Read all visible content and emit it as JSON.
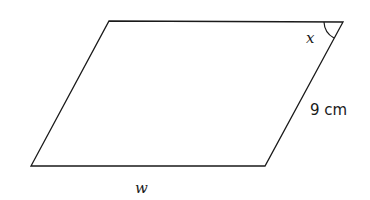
{
  "diagram": {
    "shape": "parallelogram",
    "stroke_color": "#1a1a1a",
    "vertices": {
      "top_left": [
        109,
        21
      ],
      "top_right": [
        343,
        22
      ],
      "bottom_right": [
        265,
        166
      ],
      "bottom_left": [
        31,
        166
      ]
    },
    "labels": {
      "angle": "x",
      "side": "9 cm",
      "base": "w"
    }
  }
}
